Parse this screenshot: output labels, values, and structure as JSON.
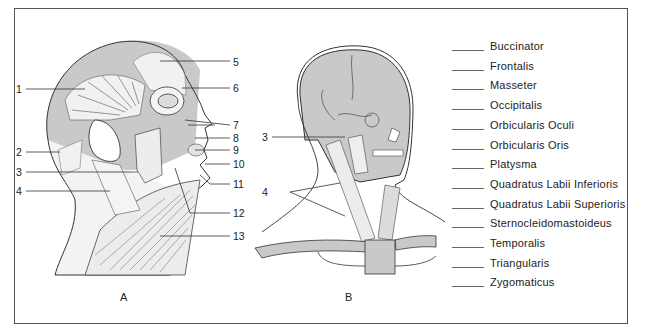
{
  "figure": {
    "panels": [
      {
        "id": "A",
        "label": "A",
        "view": "lateral head and neck muscles",
        "callouts": [
          "1",
          "2",
          "3",
          "4",
          "5",
          "6",
          "7",
          "8",
          "9",
          "10",
          "11",
          "12",
          "13"
        ]
      },
      {
        "id": "B",
        "label": "B",
        "view": "anterolateral skull and neck",
        "callouts": [
          "3",
          "4"
        ]
      }
    ]
  },
  "legend": {
    "items": [
      {
        "blank": "",
        "label": "Buccinator"
      },
      {
        "blank": "",
        "label": "Frontalis"
      },
      {
        "blank": "",
        "label": "Masseter"
      },
      {
        "blank": "",
        "label": "Occipitalis"
      },
      {
        "blank": "",
        "label": "Orbicularis Oculi"
      },
      {
        "blank": "",
        "label": "Orbicularis Oris"
      },
      {
        "blank": "",
        "label": "Platysma"
      },
      {
        "blank": "",
        "label": "Quadratus Labii Inferioris"
      },
      {
        "blank": "",
        "label": "Quadratus Labii Superioris"
      },
      {
        "blank": "",
        "label": "Sternocleidomastoideus"
      },
      {
        "blank": "",
        "label": "Temporalis"
      },
      {
        "blank": "",
        "label": "Triangularis"
      },
      {
        "blank": "",
        "label": "Zygomaticus"
      }
    ]
  },
  "colors": {
    "skin_gray": "#c9c9c9",
    "line": "#333333",
    "frame": "#555555",
    "background": "#ffffff"
  }
}
